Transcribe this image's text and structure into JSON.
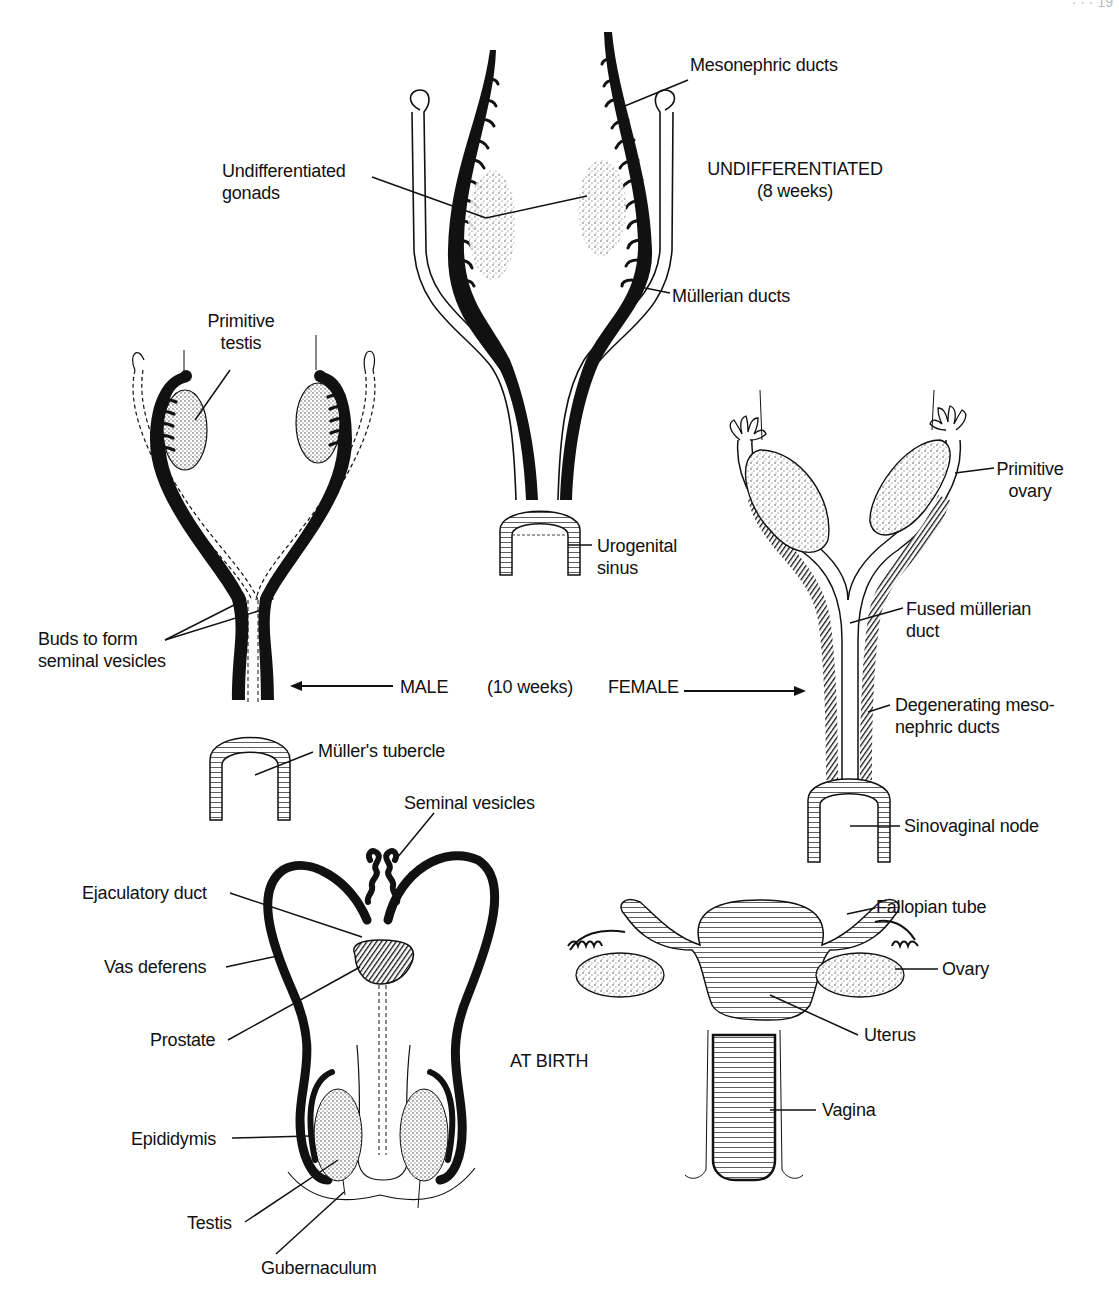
{
  "figure": {
    "page_header_fragment": "· · · 19",
    "stage_titles": {
      "undifferentiated": "UNDIFFERENTIATED\n(8 weeks)",
      "male": "MALE",
      "ten_weeks": "(10 weeks)",
      "female": "FEMALE",
      "at_birth": "AT BIRTH"
    },
    "undifferentiated_labels": {
      "mesonephric_ducts": "Mesonephric ducts",
      "undifferentiated_gonads": "Undifferentiated\ngonads",
      "mullerian_ducts": "Müllerian ducts",
      "urogenital_sinus": "Urogenital\nsinus"
    },
    "male_10wk_labels": {
      "primitive_testis": "Primitive\ntestis",
      "buds_seminal_vesicles": "Buds to form\nseminal vesicles",
      "mullers_tubercle": "Müller's tubercle"
    },
    "female_10wk_labels": {
      "primitive_ovary": "Primitive\novary",
      "fused_mullerian_duct": "Fused müllerian\nduct",
      "degenerating_mesonephric_ducts": "Degenerating meso-\nnephric ducts",
      "sinovaginal_node": "Sinovaginal node"
    },
    "male_birth_labels": {
      "seminal_vesicles": "Seminal vesicles",
      "ejaculatory_duct": "Ejaculatory duct",
      "vas_deferens": "Vas deferens",
      "prostate": "Prostate",
      "epididymis": "Epididymis",
      "testis": "Testis",
      "gubernaculum": "Gubernaculum"
    },
    "female_birth_labels": {
      "fallopian_tube": "Fallopian tube",
      "ovary": "Ovary",
      "uterus": "Uterus",
      "vagina": "Vagina"
    },
    "colors": {
      "ink": "#111111",
      "paper": "#ffffff",
      "stipple": "#555555"
    }
  }
}
